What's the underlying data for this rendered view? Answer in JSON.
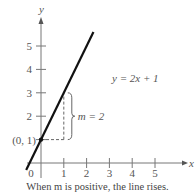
{
  "chart_data": {
    "type": "line",
    "title": "",
    "equation_label": "y = 2x + 1",
    "xlabel": "x",
    "ylabel": "y",
    "xlim": [
      -0.65,
      6
    ],
    "ylim": [
      -0.3,
      6
    ],
    "x_ticks": [
      1,
      2,
      3,
      4,
      5
    ],
    "x_tick_labels": [
      "1",
      "2",
      "3",
      "4",
      "5"
    ],
    "y_ticks": [
      1,
      2,
      3,
      4,
      5
    ],
    "y_tick_labels": [
      "",
      "2",
      "3",
      "4",
      "5"
    ],
    "origin_label": "0",
    "grid": false,
    "series": [
      {
        "name": "y = 2x + 1",
        "slope": 2,
        "intercept": 1,
        "x_range": [
          -0.65,
          2.3
        ],
        "color": "#111111"
      }
    ],
    "points": [
      {
        "label": "(0, 1)",
        "x": 0,
        "y": 1
      }
    ],
    "annotations": {
      "rise_label": "m = 2",
      "run_from": [
        0,
        1
      ],
      "run_to": [
        1,
        1
      ],
      "rise_to": [
        1,
        3
      ]
    },
    "caption": "When m is positive, the line rises."
  }
}
